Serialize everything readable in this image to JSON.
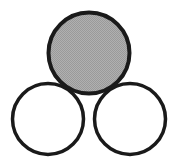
{
  "figure": {
    "name": "three-circles-triangular-arrangement",
    "width": 175,
    "height": 163,
    "background_color": "#ffffff",
    "stroke_color": "#1a1a1a",
    "stroke_width": 3.5,
    "fill_gray": "#a6a6a6",
    "fill_white": "#ffffff",
    "shapes": [
      {
        "id": "circle-bottom-left",
        "label": "bottom-left-circle",
        "cx": 48,
        "cy": 119,
        "r": 35.5,
        "fill": "#ffffff",
        "filled": "no",
        "stroke": "#1a1a1a",
        "stroke_width": 3.5
      },
      {
        "id": "circle-bottom-right",
        "label": "bottom-right-circle",
        "cx": 130,
        "cy": 119,
        "r": 35.5,
        "fill": "#ffffff",
        "filled": "no",
        "stroke": "#1a1a1a",
        "stroke_width": 3.5
      },
      {
        "id": "circle-top",
        "label": "top-shaded-circle",
        "cx": 89,
        "cy": 53,
        "r": 40.5,
        "fill": "#a6a6a6",
        "filled": "yes",
        "stroke": "#1a1a1a",
        "stroke_width": 4
      }
    ]
  }
}
